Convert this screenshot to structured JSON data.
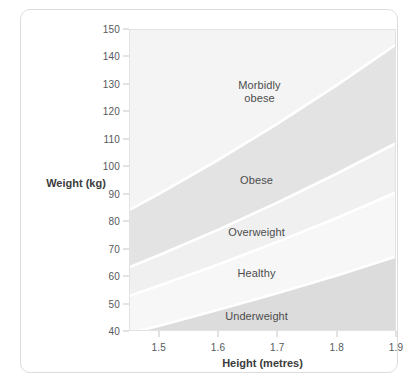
{
  "chart_data": {
    "type": "area",
    "title": "",
    "subtitle": "",
    "xlabel": "Height (metres)",
    "ylabel": "Weight (kg)",
    "xlim": [
      1.45,
      1.9
    ],
    "ylim": [
      40,
      150
    ],
    "xticks": [
      "1.5",
      "1.6",
      "1.7",
      "1.8",
      "1.9"
    ],
    "xtick_values": [
      1.5,
      1.6,
      1.7,
      1.8,
      1.9
    ],
    "yticks": [
      "150",
      "140",
      "130",
      "120",
      "110",
      "100",
      "90",
      "80",
      "70",
      "60",
      "50",
      "40"
    ],
    "ytick_values": [
      150,
      140,
      130,
      120,
      110,
      100,
      90,
      80,
      70,
      60,
      50,
      40
    ],
    "grid": false,
    "legend": "none",
    "bands": [
      {
        "label": "Morbidly obese",
        "label_lines": "Morbidly\nobese",
        "bmi_range": "40+",
        "bmi_lower": 40,
        "bmi_upper": null,
        "color": "#f4f4f4",
        "label_x": 1.67,
        "label_y": 127
      },
      {
        "label": "Obese",
        "label_lines": "Obese",
        "bmi_range": "30-40",
        "bmi_lower": 30,
        "bmi_upper": 40,
        "color": "#e3e3e3",
        "label_x": 1.665,
        "label_y": 95
      },
      {
        "label": "Overweight",
        "label_lines": "Overweight",
        "bmi_range": "25-30",
        "bmi_lower": 25,
        "bmi_upper": 30,
        "color": "#f0f0f0",
        "label_x": 1.665,
        "label_y": 76
      },
      {
        "label": "Healthy",
        "label_lines": "Healthy",
        "bmi_range": "18.5-25",
        "bmi_lower": 18.5,
        "bmi_upper": 25,
        "color": "#f7f7f7",
        "label_x": 1.665,
        "label_y": 61
      },
      {
        "label": "Underweight",
        "label_lines": "Underweight",
        "bmi_range": "under 18.5",
        "bmi_lower": null,
        "bmi_upper": 18.5,
        "color": "#dcdcdc",
        "label_x": 1.665,
        "label_y": 45.5
      }
    ],
    "boundary_curves": [
      {
        "name": "underweight-healthy",
        "bmi": 18.5,
        "points": [
          [
            1.45,
            38.9
          ],
          [
            1.5,
            41.6
          ],
          [
            1.6,
            47.4
          ],
          [
            1.7,
            53.5
          ],
          [
            1.8,
            59.9
          ],
          [
            1.9,
            66.8
          ]
        ]
      },
      {
        "name": "healthy-overweight",
        "bmi": 25,
        "points": [
          [
            1.45,
            52.6
          ],
          [
            1.5,
            56.3
          ],
          [
            1.6,
            64.0
          ],
          [
            1.7,
            72.3
          ],
          [
            1.8,
            81.0
          ],
          [
            1.9,
            90.3
          ]
        ]
      },
      {
        "name": "overweight-obese",
        "bmi": 30,
        "points": [
          [
            1.45,
            63.1
          ],
          [
            1.5,
            67.5
          ],
          [
            1.6,
            76.8
          ],
          [
            1.7,
            86.7
          ],
          [
            1.8,
            97.2
          ],
          [
            1.9,
            108.3
          ]
        ]
      },
      {
        "name": "obese-morbidly-obese",
        "bmi": 40,
        "points": [
          [
            1.45,
            84.1
          ],
          [
            1.5,
            90.0
          ],
          [
            1.6,
            102.4
          ],
          [
            1.7,
            115.6
          ],
          [
            1.8,
            129.6
          ],
          [
            1.9,
            144.4
          ]
        ]
      }
    ],
    "colors": {
      "plot_background": "#f2f2f2",
      "band_separator": "#ffffff",
      "axis_text": "#55595c",
      "axis_title": "#3c3c3c",
      "band_label": "#4c4c4c",
      "card_border": "#dcdcdc",
      "plot_border": "#e2e2e2"
    }
  }
}
